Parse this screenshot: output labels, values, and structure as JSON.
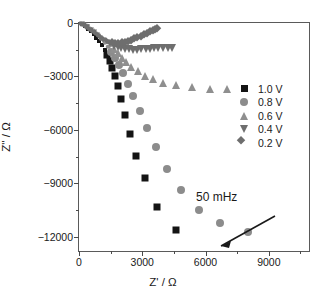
{
  "chart_data": {
    "type": "scatter",
    "title": "",
    "xlabel": "Z' / Ω",
    "ylabel": "Z'' / Ω",
    "xlim": [
      0,
      11000
    ],
    "ylim": [
      0,
      -12900
    ],
    "xticks": [
      0,
      3000,
      6000,
      9000
    ],
    "xtick_labels": [
      "0",
      "3000",
      "6000",
      "9000"
    ],
    "yticks": [
      0,
      -3000,
      -6000,
      -9000,
      -12000
    ],
    "ytick_labels": [
      "0",
      "−3000",
      "−6000",
      "−9000",
      "−12000"
    ],
    "grid": false,
    "legend_position": "upper right",
    "annotations": [
      {
        "text": "50 mHz",
        "arrow_from_xy": [
          4300,
          -2150
        ],
        "arrow_to_xy": [
          1950,
          -1150
        ]
      }
    ],
    "series": [
      {
        "name": "1.0 V",
        "marker": "square",
        "color": "#141414",
        "points": [
          [
            150,
            -60
          ],
          [
            300,
            -170
          ],
          [
            440,
            -310
          ],
          [
            570,
            -470
          ],
          [
            700,
            -640
          ],
          [
            820,
            -830
          ],
          [
            950,
            -1030
          ],
          [
            1080,
            -1260
          ],
          [
            1210,
            -1520
          ],
          [
            1330,
            -1810
          ],
          [
            1450,
            -2140
          ],
          [
            1560,
            -2520
          ],
          [
            1700,
            -2980
          ],
          [
            1830,
            -3550
          ],
          [
            1980,
            -4250
          ],
          [
            2180,
            -5150
          ],
          [
            2420,
            -6200
          ],
          [
            2700,
            -7450
          ],
          [
            3120,
            -8700
          ],
          [
            3700,
            -10300
          ],
          [
            4600,
            -11600
          ]
        ]
      },
      {
        "name": "0.8 V",
        "marker": "circle",
        "color": "#8c8c8c",
        "points": [
          [
            200,
            -70
          ],
          [
            380,
            -190
          ],
          [
            560,
            -330
          ],
          [
            740,
            -490
          ],
          [
            900,
            -660
          ],
          [
            1060,
            -860
          ],
          [
            1220,
            -1080
          ],
          [
            1380,
            -1330
          ],
          [
            1540,
            -1620
          ],
          [
            1700,
            -1960
          ],
          [
            1880,
            -2350
          ],
          [
            2080,
            -2820
          ],
          [
            2300,
            -3400
          ],
          [
            2560,
            -4100
          ],
          [
            2870,
            -4950
          ],
          [
            3230,
            -5900
          ],
          [
            3650,
            -6950
          ],
          [
            4160,
            -8200
          ],
          [
            4850,
            -9350
          ],
          [
            5700,
            -10500
          ],
          [
            6700,
            -11200
          ],
          [
            8000,
            -11750
          ]
        ]
      },
      {
        "name": "0.6 V",
        "marker": "triangle-up",
        "color": "#8f8f8f",
        "points": [
          [
            180,
            -60
          ],
          [
            350,
            -160
          ],
          [
            520,
            -280
          ],
          [
            690,
            -410
          ],
          [
            850,
            -550
          ],
          [
            1000,
            -700
          ],
          [
            1160,
            -870
          ],
          [
            1320,
            -1050
          ],
          [
            1480,
            -1250
          ],
          [
            1650,
            -1470
          ],
          [
            1830,
            -1700
          ],
          [
            2020,
            -1950
          ],
          [
            2230,
            -2200
          ],
          [
            2480,
            -2450
          ],
          [
            2780,
            -2700
          ],
          [
            3120,
            -2950
          ],
          [
            3520,
            -3150
          ],
          [
            4000,
            -3350
          ],
          [
            4600,
            -3500
          ],
          [
            5350,
            -3600
          ],
          [
            6200,
            -3680
          ],
          [
            7000,
            -3700
          ]
        ]
      },
      {
        "name": "0.4 V",
        "marker": "triangle-down",
        "color": "#6e6e6e",
        "points": [
          [
            120,
            -50
          ],
          [
            260,
            -140
          ],
          [
            400,
            -250
          ],
          [
            550,
            -380
          ],
          [
            700,
            -520
          ],
          [
            860,
            -670
          ],
          [
            1000,
            -820
          ],
          [
            1160,
            -960
          ],
          [
            1320,
            -1090
          ],
          [
            1480,
            -1200
          ],
          [
            1650,
            -1290
          ],
          [
            1830,
            -1360
          ],
          [
            2000,
            -1420
          ],
          [
            2180,
            -1460
          ],
          [
            2380,
            -1480
          ],
          [
            2560,
            -1500
          ],
          [
            2760,
            -1490
          ],
          [
            2960,
            -1470
          ],
          [
            3160,
            -1450
          ],
          [
            3360,
            -1440
          ],
          [
            3560,
            -1430
          ],
          [
            3760,
            -1420
          ],
          [
            3980,
            -1410
          ],
          [
            4200,
            -1400
          ],
          [
            4400,
            -1390
          ]
        ]
      },
      {
        "name": "0.2 V",
        "marker": "diamond",
        "color": "#6e6e6e",
        "points": [
          [
            110,
            -40
          ],
          [
            230,
            -120
          ],
          [
            350,
            -220
          ],
          [
            480,
            -330
          ],
          [
            610,
            -450
          ],
          [
            740,
            -570
          ],
          [
            880,
            -690
          ],
          [
            1010,
            -800
          ],
          [
            1150,
            -900
          ],
          [
            1290,
            -980
          ],
          [
            1430,
            -1040
          ],
          [
            1570,
            -1080
          ],
          [
            1720,
            -1100
          ],
          [
            1870,
            -1100
          ],
          [
            2020,
            -1080
          ],
          [
            2170,
            -1040
          ],
          [
            2320,
            -990
          ],
          [
            2470,
            -930
          ],
          [
            2620,
            -860
          ],
          [
            2770,
            -790
          ],
          [
            2920,
            -710
          ],
          [
            3070,
            -630
          ],
          [
            3220,
            -550
          ],
          [
            3360,
            -470
          ],
          [
            3500,
            -390
          ],
          [
            3620,
            -320
          ],
          [
            3720,
            -260
          ]
        ]
      }
    ]
  },
  "axes": {
    "xaxis_title": "Z' / Ω",
    "yaxis_title": "Z'' / Ω"
  },
  "legend": {
    "items": [
      {
        "label": "1.0 V",
        "marker": "square",
        "color": "#141414"
      },
      {
        "label": "0.8 V",
        "marker": "circle",
        "color": "#8c8c8c"
      },
      {
        "label": "0.6 V",
        "marker": "triangle-up",
        "color": "#8f8f8f"
      },
      {
        "label": "0.4 V",
        "marker": "triangle-down",
        "color": "#6e6e6e"
      },
      {
        "label": "0.2 V",
        "marker": "diamond",
        "color": "#6e6e6e"
      }
    ]
  },
  "annotation": {
    "label": "50 mHz"
  }
}
